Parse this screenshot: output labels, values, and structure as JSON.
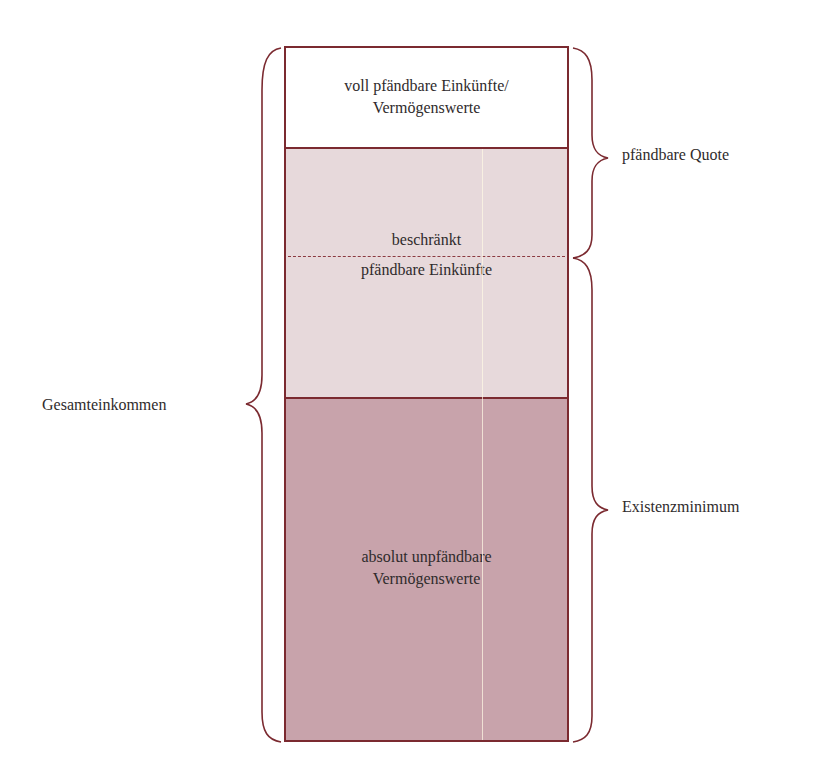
{
  "diagram": {
    "title": "",
    "colors": {
      "border": "#7b2a30",
      "full_segment": "#ffffff",
      "limited_segment": "#e7d9db",
      "exempt_segment": "#c8a3ab",
      "text": "#2f2b2c"
    },
    "segments": [
      {
        "id": "full",
        "label_line1": "voll pfändbare Einkünfte/",
        "label_line2": "Vermögenswerte"
      },
      {
        "id": "limited",
        "label_upper": "beschränkt",
        "label_lower": "pfändbare Einkünfte"
      },
      {
        "id": "exempt",
        "label_line1": "absolut unpfändbare",
        "label_line2": "Vermögenswerte"
      }
    ],
    "braces": {
      "left": {
        "label": "Gesamteinkommen"
      },
      "right_top": {
        "label": "pfändbare Quote"
      },
      "right_bottom": {
        "label": "Existenzminimum"
      }
    }
  }
}
